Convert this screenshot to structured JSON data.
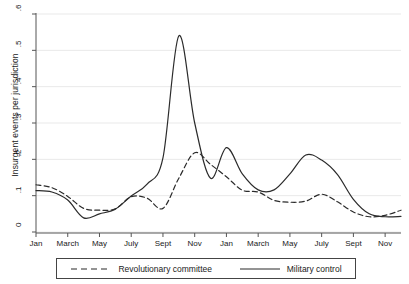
{
  "chart_data": {
    "type": "line",
    "title": "",
    "xlabel": "",
    "ylabel": "Insurgent events per jurisdiction",
    "ylim": [
      0,
      0.6
    ],
    "yticks": [
      0,
      0.1,
      0.2,
      0.3,
      0.4,
      0.5,
      0.6
    ],
    "ytick_labels": [
      "0",
      ".1",
      ".2",
      ".3",
      ".4",
      ".5",
      ".6"
    ],
    "grid": "horizontal",
    "legend_position": "below",
    "x": [
      1,
      2,
      3,
      4,
      5,
      6,
      7,
      8,
      9,
      10,
      11,
      12,
      13,
      14,
      15,
      16,
      17,
      18,
      19,
      20,
      21,
      22,
      23,
      24
    ],
    "xticks": [
      1,
      3,
      5,
      7,
      9,
      11,
      13,
      15,
      17,
      19,
      21,
      23
    ],
    "xtick_labels": [
      "Jan",
      "March",
      "May",
      "July",
      "Sept",
      "Nov",
      "Jan",
      "March",
      "May",
      "July",
      "Sept",
      "Nov"
    ],
    "series": [
      {
        "name": "Revolutionary committee",
        "style": "dashed",
        "color": "#2b2b2b",
        "values": [
          0.13,
          0.122,
          0.098,
          0.065,
          0.06,
          0.064,
          0.097,
          0.093,
          0.065,
          0.148,
          0.218,
          0.186,
          0.152,
          0.115,
          0.11,
          0.087,
          0.082,
          0.085,
          0.104,
          0.083,
          0.055,
          0.042,
          0.046,
          0.06
        ]
      },
      {
        "name": "Military control",
        "style": "solid",
        "color": "#2b2b2b",
        "values": [
          0.114,
          0.11,
          0.088,
          0.039,
          0.05,
          0.063,
          0.099,
          0.132,
          0.204,
          0.54,
          0.3,
          0.148,
          0.232,
          0.16,
          0.116,
          0.116,
          0.16,
          0.212,
          0.198,
          0.158,
          0.09,
          0.05,
          0.042,
          0.043
        ]
      }
    ]
  },
  "legend": {
    "items": [
      {
        "label": "Revolutionary committee",
        "style": "dashed"
      },
      {
        "label": "Military control",
        "style": "solid"
      }
    ]
  }
}
